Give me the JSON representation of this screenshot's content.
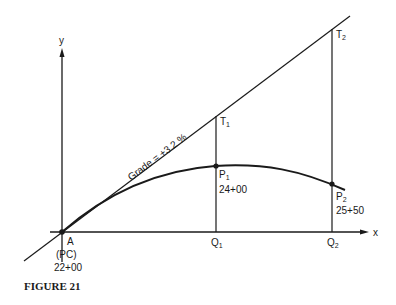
{
  "figure": {
    "caption": "FIGURE 21",
    "axes": {
      "x_label": "x",
      "y_label": "y"
    },
    "tangent": {
      "label": "Grade = +3.2 %"
    },
    "points": {
      "A": {
        "name": "A",
        "sub": "(PC)",
        "station": "22+00"
      },
      "T1": {
        "name": "T",
        "subscript": "1"
      },
      "T2": {
        "name": "T",
        "subscript": "2"
      },
      "P1": {
        "name": "P",
        "subscript": "1",
        "station": "24+00"
      },
      "P2": {
        "name": "P",
        "subscript": "2",
        "station": "25+50"
      },
      "Q1": {
        "name": "Q",
        "subscript": "1"
      },
      "Q2": {
        "name": "Q",
        "subscript": "2"
      }
    },
    "colors": {
      "ink": "#1a1a1a",
      "background": "#ffffff"
    }
  }
}
